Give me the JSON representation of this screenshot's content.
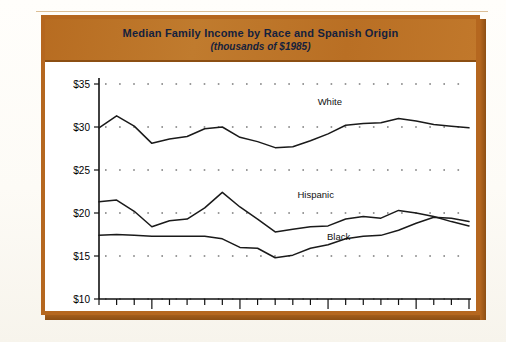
{
  "figure": {
    "title": "Median Family Income by Race and Spanish Origin",
    "subtitle": "(thousands of $1985)",
    "frame_color": "#b5671f",
    "band_color": "#bd7125",
    "title_color": "#14213d",
    "plot_background": "#ffffff",
    "line_color": "#1a1a1a"
  },
  "chart_data": {
    "type": "line",
    "title": "Median Family Income by Race and Spanish Origin",
    "subtitle": "(thousands of $1985)",
    "xlabel": "",
    "ylabel": "",
    "xlim": [
      1972,
      1993
    ],
    "ylim": [
      10,
      35
    ],
    "ytick_labels": [
      "$35",
      "$30",
      "$25",
      "$20",
      "$15",
      "$10"
    ],
    "ytick_values": [
      35,
      30,
      25,
      20,
      15,
      10
    ],
    "yticks_step": 5,
    "xtick_labels": [
      "1975",
      "1980",
      "1985",
      "1990",
      "1993"
    ],
    "xtick_values": [
      1975,
      1980,
      1985,
      1990,
      1993
    ],
    "x_minor_ticks_every": 1,
    "grid": "dotted-horizontal",
    "legend": "inline-series-labels",
    "x": [
      1972,
      1973,
      1974,
      1975,
      1976,
      1977,
      1978,
      1979,
      1980,
      1981,
      1982,
      1983,
      1984,
      1985,
      1986,
      1987,
      1988,
      1989,
      1990,
      1991,
      1992,
      1993
    ],
    "series": [
      {
        "name": "White",
        "label": "White",
        "label_x": 1985.1,
        "label_y": 32.6,
        "values": [
          29.9,
          31.3,
          30.1,
          28.1,
          28.6,
          28.9,
          29.8,
          30.0,
          28.8,
          28.3,
          27.6,
          27.7,
          28.4,
          29.2,
          30.2,
          30.4,
          30.5,
          31.0,
          30.7,
          30.3,
          30.1,
          29.9
        ]
      },
      {
        "name": "Hispanic",
        "label": "Hispanic",
        "label_x": 1984.3,
        "label_y": 21.7,
        "values": [
          21.3,
          21.5,
          20.2,
          18.4,
          19.1,
          19.3,
          20.6,
          22.4,
          20.7,
          19.3,
          17.8,
          18.1,
          18.4,
          18.5,
          19.3,
          19.6,
          19.4,
          20.3,
          20.0,
          19.6,
          19.0,
          18.5
        ]
      },
      {
        "name": "Black",
        "label": "Black",
        "label_x": 1985.6,
        "label_y": 16.9,
        "values": [
          17.4,
          17.5,
          17.4,
          17.3,
          17.3,
          17.3,
          17.3,
          17.0,
          16.0,
          15.9,
          14.8,
          15.1,
          15.9,
          16.3,
          17.0,
          17.3,
          17.4,
          18.0,
          18.8,
          19.5,
          19.4,
          19.0
        ]
      }
    ],
    "series_lower_correction": {
      "note": "Black series drawn as the lower of the two bottom curves"
    }
  }
}
